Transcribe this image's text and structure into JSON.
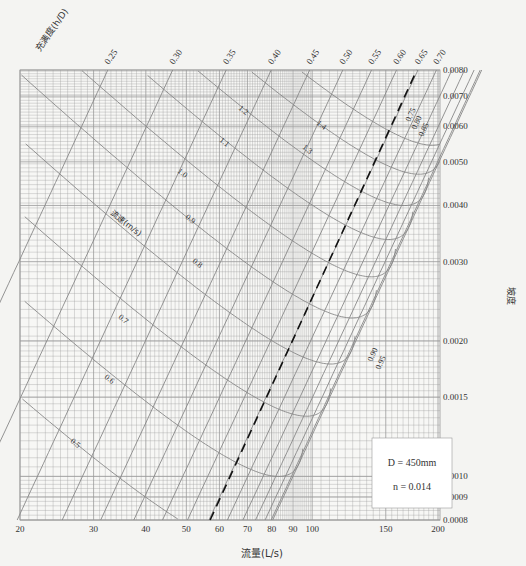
{
  "chart_data": {
    "type": "nomograph",
    "parameters": {
      "D_label": "D = 450mm",
      "n_label": "n = 0.014",
      "D_mm": 450,
      "n": 0.014
    },
    "xlabel": "流量(L/s)",
    "ylabel": "坡度",
    "x_scale": "log",
    "y_scale": "log",
    "xlim": [
      20,
      200
    ],
    "ylim": [
      0.0008,
      0.008
    ],
    "x_ticks": [
      20,
      30,
      40,
      50,
      60,
      70,
      80,
      90,
      100,
      150,
      200
    ],
    "y_ticks": [
      0.008,
      0.007,
      0.006,
      0.005,
      0.004,
      0.003,
      0.002,
      0.0015,
      0.001,
      0.0009,
      0.0008
    ],
    "y_tick_labels": [
      "0.0080",
      "0.0070",
      "0.0060",
      "0.0050",
      "0.0040",
      "0.0030",
      "0.0020",
      "0.0015",
      "0.0010",
      "0.0009",
      "0.0008"
    ],
    "fullness_label": "充满度(h/D)",
    "fullness_values": [
      0.25,
      0.3,
      0.35,
      0.4,
      0.45,
      0.5,
      0.55,
      0.6,
      0.65,
      0.7,
      0.75,
      0.8,
      0.85,
      0.9,
      0.95
    ],
    "fullness_top_labels": [
      "0.25",
      "0.30",
      "0.35",
      "0.40",
      "0.45",
      "0.50",
      "0.55",
      "0.60",
      "0.65",
      "0.70"
    ],
    "fullness_side_labels": [
      "0.75",
      "0.80",
      "0.85",
      "0.90",
      "0.95"
    ],
    "velocity_label": "流速(m/s)",
    "velocity_values": [
      0.5,
      0.6,
      0.7,
      0.8,
      0.9,
      1.0,
      1.1,
      1.2,
      1.3,
      1.4
    ],
    "velocity_labels": [
      "0.5",
      "0.6",
      "0.7",
      "0.8",
      "0.9",
      "1.0",
      "1.1",
      "1.2",
      "1.3",
      "1.4"
    ],
    "full_flow_line": "dashed line (h/D = 1.0 reference, passes ~Q=57 at i=0.0008 to ~Q=178 at i=0.008)",
    "grid": true,
    "legend_position": "lower-right box"
  },
  "colors": {
    "background": "#f4f4f2",
    "grid": "#9a9a9a",
    "curve": "#888888",
    "text": "#333333",
    "dashed": "#111111"
  }
}
